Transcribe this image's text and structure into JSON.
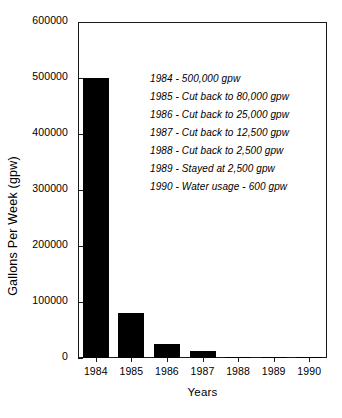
{
  "chart_data": {
    "type": "bar",
    "title": "",
    "xlabel": "Years",
    "ylabel": "Gallons Per Week (gpw)",
    "categories": [
      "1984",
      "1985",
      "1986",
      "1987",
      "1988",
      "1989",
      "1990"
    ],
    "values": [
      500000,
      80000,
      25000,
      12500,
      2500,
      2500,
      600
    ],
    "ylim": [
      0,
      600000
    ],
    "yticks": [
      "0",
      "100000",
      "200000",
      "300000",
      "400000",
      "500000",
      "600000"
    ],
    "ytick_values": [
      0,
      100000,
      200000,
      300000,
      400000,
      500000,
      600000
    ],
    "grid": false,
    "legend": false,
    "bar_color": "#000000",
    "axis_color": "#1a1a1a",
    "annotations": [
      "1984 - 500,000 gpw",
      "1985 - Cut back to 80,000 gpw",
      "1986 - Cut back to 25,000 gpw",
      "1987 - Cut back to 12,500 gpw",
      "1988 - Cut back to 2,500 gpw",
      "1989 - Stayed at 2,500 gpw",
      "1990 - Water usage - 600 gpw"
    ]
  }
}
